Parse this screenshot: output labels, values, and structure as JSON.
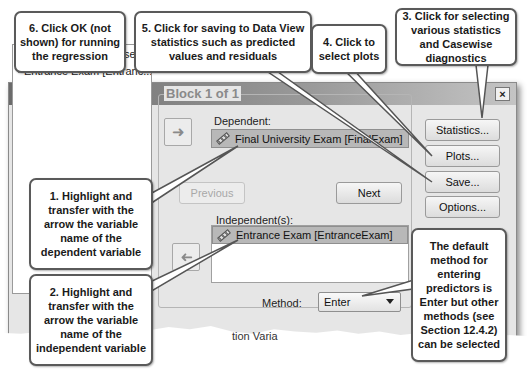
{
  "dialog": {
    "title": "Linear Regression",
    "close_label": "×"
  },
  "variables": [
    {
      "label": "Case Number [Case]",
      "icon": "scale-ruler-icon"
    },
    {
      "label": "Entrance Exam [Entranc...",
      "icon": "scale-ruler-icon"
    }
  ],
  "dependent": {
    "label": "Dependent:",
    "value": "Final University Exam [FinalExam]",
    "arrow": "➜"
  },
  "block": {
    "legend": "Block 1 of 1",
    "previous_label": "Previous",
    "next_label": "Next"
  },
  "independents": {
    "label": "Independent(s):",
    "items": [
      "Entrance Exam [EntranceExam]"
    ],
    "arrow": "➜"
  },
  "method": {
    "label": "Method:",
    "value": "Enter"
  },
  "side_buttons": {
    "statistics": "Statistics...",
    "plots": "Plots...",
    "save": "Save...",
    "options": "Options..."
  },
  "partial_text": "tion Varia",
  "callouts": {
    "c1": "1.  Highlight and transfer with the arrow the variable name of the dependent variable",
    "c2": "2.  Highlight and transfer with the arrow the variable name of the independent variable",
    "c3": "3.  Click for selecting various statistics and Casewise diagnostics",
    "c4": "4.  Click to select plots",
    "c5": "5.  Click for saving to Data View statistics such as predicted values and residuals",
    "c6": "6.  Click OK (not shown) for running the regression",
    "c7": "The default method for entering predictors is Enter but other methods (see Section 12.4.2) can be selected"
  }
}
